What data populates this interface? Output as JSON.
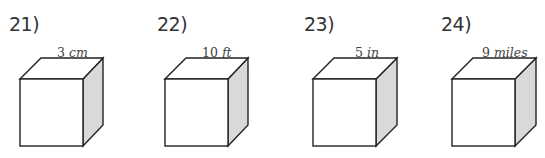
{
  "problems": [
    {
      "number": "21)",
      "value": "3",
      "unit": "cm"
    },
    {
      "number": "22)",
      "value": "10",
      "unit": "ft"
    },
    {
      "number": "23)",
      "value": "5",
      "unit": "in"
    },
    {
      "number": "24)",
      "value": "9",
      "unit": "miles"
    }
  ],
  "colors": {
    "side_face": "#d9d9d9",
    "edge": "#222222"
  }
}
